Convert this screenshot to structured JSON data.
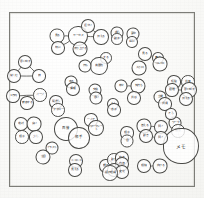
{
  "document": {
    "kind": "hand-drawn-concept-map",
    "title": "",
    "ink_color": "#4a4a47",
    "paper_color": "#fbfbfa",
    "frame_color": "#7d7d78"
  },
  "nodes": [
    {
      "id": "n1",
      "label": "見る",
      "x": 57,
      "y": 36,
      "r": 7.5,
      "size": "tiny"
    },
    {
      "id": "n2",
      "label": "サーカス",
      "x": 78,
      "y": 36,
      "r": 10,
      "size": "tiny"
    },
    {
      "id": "n3",
      "label": "伝える",
      "x": 101,
      "y": 37,
      "r": 8,
      "size": "tiny"
    },
    {
      "id": "n4",
      "label": "遣かい",
      "x": 88,
      "y": 26,
      "r": 7,
      "size": "tiny"
    },
    {
      "id": "n5",
      "label": "特に",
      "x": 58,
      "y": 48,
      "r": 7,
      "size": "tiny"
    },
    {
      "id": "n6",
      "label": "盛り上げる",
      "x": 80,
      "y": 49,
      "r": 7.5,
      "size": "tiny"
    },
    {
      "id": "n7",
      "label": "誘う",
      "x": 117,
      "y": 33,
      "r": 6.5,
      "size": "tiny"
    },
    {
      "id": "n8",
      "label": "動す",
      "x": 117,
      "y": 39,
      "r": 6,
      "size": "tiny"
    },
    {
      "id": "n9",
      "label": "夢中",
      "x": 133,
      "y": 34,
      "r": 6.5,
      "size": "tiny"
    },
    {
      "id": "n10",
      "label": "ねに",
      "x": 132,
      "y": 42,
      "r": 6,
      "size": "tiny"
    },
    {
      "id": "n11",
      "label": "見る",
      "x": 145,
      "y": 54,
      "r": 7,
      "size": "tiny"
    },
    {
      "id": "n12",
      "label": "高々",
      "x": 158,
      "y": 58,
      "r": 6,
      "size": "tiny"
    },
    {
      "id": "n13",
      "label": "ツルコミ",
      "x": 160,
      "y": 64,
      "r": 7.5,
      "size": "tiny"
    },
    {
      "id": "n14",
      "label": "入り口",
      "x": 139,
      "y": 68,
      "r": 7.5,
      "size": "tiny"
    },
    {
      "id": "n15",
      "label": "する",
      "x": 106,
      "y": 58,
      "r": 6,
      "size": "tiny"
    },
    {
      "id": "n16",
      "label": "遊園地",
      "x": 99,
      "y": 66,
      "r": 9,
      "size": "tiny"
    },
    {
      "id": "n17",
      "label": "何も",
      "x": 85,
      "y": 66,
      "r": 6.5,
      "size": "tiny"
    },
    {
      "id": "n18",
      "label": "思い出す",
      "x": 25,
      "y": 62,
      "r": 7,
      "size": "tiny"
    },
    {
      "id": "n19",
      "label": "楽しむ",
      "x": 14,
      "y": 76,
      "r": 7,
      "size": "tiny"
    },
    {
      "id": "n20",
      "label": "娘",
      "x": 39,
      "y": 76,
      "r": 7,
      "size": "tiny"
    },
    {
      "id": "n21",
      "label": "1万円",
      "x": 13,
      "y": 96,
      "r": 7,
      "size": "tiny"
    },
    {
      "id": "n22",
      "label": "ページ",
      "x": 40,
      "y": 95,
      "r": 7,
      "size": "tiny"
    },
    {
      "id": "n23",
      "label": "散歩する",
      "x": 27,
      "y": 103,
      "r": 7,
      "size": "tiny"
    },
    {
      "id": "n24",
      "label": "売る",
      "x": 71,
      "y": 82,
      "r": 6.5,
      "size": "tiny"
    },
    {
      "id": "n25",
      "label": "情報",
      "x": 73,
      "y": 89,
      "r": 7,
      "size": "tiny"
    },
    {
      "id": "n26",
      "label": "交換",
      "x": 95,
      "y": 90,
      "r": 6.5,
      "size": "tiny"
    },
    {
      "id": "n27",
      "label": "思い",
      "x": 96,
      "y": 98,
      "r": 6.5,
      "size": "tiny"
    },
    {
      "id": "n28",
      "label": "間違う",
      "x": 56,
      "y": 102,
      "r": 7,
      "size": "tiny"
    },
    {
      "id": "n29",
      "label": "フォロー",
      "x": 58,
      "y": 110,
      "r": 7,
      "size": "tiny"
    },
    {
      "id": "n30",
      "label": "様々",
      "x": 121,
      "y": 86,
      "r": 6.5,
      "size": "tiny"
    },
    {
      "id": "n31",
      "label": "気持ち",
      "x": 138,
      "y": 86,
      "r": 7.5,
      "size": "tiny"
    },
    {
      "id": "n32",
      "label": "共感",
      "x": 134,
      "y": 98,
      "r": 7,
      "size": "tiny"
    },
    {
      "id": "n33",
      "label": "1人",
      "x": 113,
      "y": 104,
      "r": 6,
      "size": "tiny"
    },
    {
      "id": "n34",
      "label": "息子",
      "x": 114,
      "y": 110,
      "r": 7,
      "size": "tiny"
    },
    {
      "id": "n35",
      "label": "経験",
      "x": 174,
      "y": 82,
      "r": 7,
      "size": "tiny"
    },
    {
      "id": "n36",
      "label": "共有",
      "x": 188,
      "y": 82,
      "r": 7,
      "size": "tiny"
    },
    {
      "id": "n37",
      "label": "話題",
      "x": 172,
      "y": 90,
      "r": 7,
      "size": "tiny"
    },
    {
      "id": "n38",
      "label": "思い出す",
      "x": 189,
      "y": 90,
      "r": 8,
      "size": "tiny"
    },
    {
      "id": "n39",
      "label": "伝える",
      "x": 186,
      "y": 99,
      "r": 7,
      "size": "tiny"
    },
    {
      "id": "n40",
      "label": "立場",
      "x": 160,
      "y": 97,
      "r": 6.5,
      "size": "tiny"
    },
    {
      "id": "n41",
      "label": "共通",
      "x": 165,
      "y": 104,
      "r": 7,
      "size": "tiny"
    },
    {
      "id": "n42",
      "label": "ワーク",
      "x": 175,
      "y": 123,
      "r": 6.5,
      "size": "tiny"
    },
    {
      "id": "n43",
      "label": "取る",
      "x": 178,
      "y": 131,
      "r": 7,
      "size": "tiny"
    },
    {
      "id": "n44",
      "label": "メモ",
      "x": 181,
      "y": 146,
      "r": 18,
      "size": "lg"
    },
    {
      "id": "n45",
      "label": "答える",
      "x": 144,
      "y": 126,
      "r": 7.5,
      "size": "tiny"
    },
    {
      "id": "n46",
      "label": "聞く",
      "x": 161,
      "y": 127,
      "r": 7,
      "size": "tiny"
    },
    {
      "id": "n47",
      "label": "動き",
      "x": 146,
      "y": 136,
      "r": 7,
      "size": "tiny"
    },
    {
      "id": "n48",
      "label": "聞く",
      "x": 161,
      "y": 138,
      "r": 7,
      "size": "tiny"
    },
    {
      "id": "n49",
      "label": "相手",
      "x": 127,
      "y": 133,
      "r": 7,
      "size": "tiny"
    },
    {
      "id": "n50",
      "label": "目",
      "x": 127,
      "y": 141,
      "r": 6.5,
      "size": "tiny"
    },
    {
      "id": "n51",
      "label": "一人で",
      "x": 91,
      "y": 120,
      "r": 7,
      "size": "tiny"
    },
    {
      "id": "n52",
      "label": "ワークシート",
      "x": 96,
      "y": 128,
      "r": 8,
      "size": "tiny"
    },
    {
      "id": "n53",
      "label": "面接",
      "x": 66,
      "y": 129,
      "r": 12,
      "size": "sm"
    },
    {
      "id": "n54",
      "label": "相手",
      "x": 79,
      "y": 138,
      "r": 11,
      "size": "sm"
    },
    {
      "id": "n55",
      "label": "絶対",
      "x": 21,
      "y": 124,
      "r": 7,
      "size": "tiny"
    },
    {
      "id": "n56",
      "label": "良い",
      "x": 34,
      "y": 124,
      "r": 7.5,
      "size": "tiny"
    },
    {
      "id": "n57",
      "label": "相手",
      "x": 22,
      "y": 137,
      "r": 7,
      "size": "tiny"
    },
    {
      "id": "n58",
      "label": "少し",
      "x": 36,
      "y": 137,
      "r": 7,
      "size": "tiny"
    },
    {
      "id": "n59",
      "label": "イラスト",
      "x": 52,
      "y": 148,
      "r": 6.5,
      "size": "tiny"
    },
    {
      "id": "n60",
      "label": "注目",
      "x": 43,
      "y": 157,
      "r": 7.5,
      "size": "tiny"
    },
    {
      "id": "n61",
      "label": "ニコニコ",
      "x": 76,
      "y": 161,
      "r": 7,
      "size": "tiny"
    },
    {
      "id": "n62",
      "label": "見える",
      "x": 75,
      "y": 170,
      "r": 7,
      "size": "tiny"
    },
    {
      "id": "n63",
      "label": "顔の",
      "x": 106,
      "y": 166,
      "r": 7,
      "size": "tiny"
    },
    {
      "id": "n64",
      "label": "動き",
      "x": 114,
      "y": 160,
      "r": 7,
      "size": "tiny"
    },
    {
      "id": "n65",
      "label": "向き",
      "x": 122,
      "y": 158,
      "r": 7,
      "size": "tiny"
    },
    {
      "id": "n66",
      "label": "内容",
      "x": 122,
      "y": 164,
      "r": 7,
      "size": "tiny"
    },
    {
      "id": "n67",
      "label": "表情",
      "x": 114,
      "y": 170,
      "r": 7,
      "size": "tiny"
    },
    {
      "id": "n68",
      "label": "変化",
      "x": 122,
      "y": 172,
      "r": 7,
      "size": "tiny"
    },
    {
      "id": "n69",
      "label": "相槌",
      "x": 144,
      "y": 166,
      "r": 7,
      "size": "tiny"
    },
    {
      "id": "n70",
      "label": "向ける",
      "x": 160,
      "y": 166,
      "r": 7.5,
      "size": "tiny"
    },
    {
      "id": "n71",
      "label": "話の理解",
      "x": 110,
      "y": 173,
      "r": 8,
      "size": "tiny"
    },
    {
      "id": "n72",
      "label": "そう",
      "x": 171,
      "y": 114,
      "r": 6,
      "size": "tiny"
    }
  ],
  "edges": [
    {
      "from": "n1",
      "to": "n2"
    },
    {
      "from": "n2",
      "to": "n3"
    },
    {
      "from": "n2",
      "to": "n4"
    },
    {
      "from": "n2",
      "to": "n5"
    },
    {
      "from": "n2",
      "to": "n6"
    },
    {
      "from": "n3",
      "to": "n4"
    },
    {
      "from": "n7",
      "to": "n8"
    },
    {
      "from": "n9",
      "to": "n10"
    },
    {
      "from": "n11",
      "to": "n12"
    },
    {
      "from": "n11",
      "to": "n14"
    },
    {
      "from": "n12",
      "to": "n13"
    },
    {
      "from": "n15",
      "to": "n16"
    },
    {
      "from": "n16",
      "to": "n17"
    },
    {
      "from": "n18",
      "to": "n19"
    },
    {
      "from": "n18",
      "to": "n20"
    },
    {
      "from": "n19",
      "to": "n20"
    },
    {
      "from": "n21",
      "to": "n22"
    },
    {
      "from": "n22",
      "to": "n23"
    },
    {
      "from": "n24",
      "to": "n25"
    },
    {
      "from": "n26",
      "to": "n27"
    },
    {
      "from": "n28",
      "to": "n29"
    },
    {
      "from": "n30",
      "to": "n31"
    },
    {
      "from": "n31",
      "to": "n32"
    },
    {
      "from": "n33",
      "to": "n34"
    },
    {
      "from": "n35",
      "to": "n36"
    },
    {
      "from": "n37",
      "to": "n38"
    },
    {
      "from": "n38",
      "to": "n39"
    },
    {
      "from": "n40",
      "to": "n41"
    },
    {
      "from": "n42",
      "to": "n43"
    },
    {
      "from": "n43",
      "to": "n44"
    },
    {
      "from": "n45",
      "to": "n46"
    },
    {
      "from": "n45",
      "to": "n47"
    },
    {
      "from": "n46",
      "to": "n48"
    },
    {
      "from": "n47",
      "to": "n48"
    },
    {
      "from": "n49",
      "to": "n50"
    },
    {
      "from": "n51",
      "to": "n52"
    },
    {
      "from": "n53",
      "to": "n54"
    },
    {
      "from": "n55",
      "to": "n56"
    },
    {
      "from": "n55",
      "to": "n57"
    },
    {
      "from": "n56",
      "to": "n58"
    },
    {
      "from": "n57",
      "to": "n58"
    },
    {
      "from": "n59",
      "to": "n60"
    },
    {
      "from": "n61",
      "to": "n62"
    },
    {
      "from": "n63",
      "to": "n67"
    },
    {
      "from": "n64",
      "to": "n65"
    },
    {
      "from": "n65",
      "to": "n66"
    },
    {
      "from": "n67",
      "to": "n68"
    },
    {
      "from": "n69",
      "to": "n70"
    },
    {
      "from": "n72",
      "to": "n42"
    }
  ]
}
